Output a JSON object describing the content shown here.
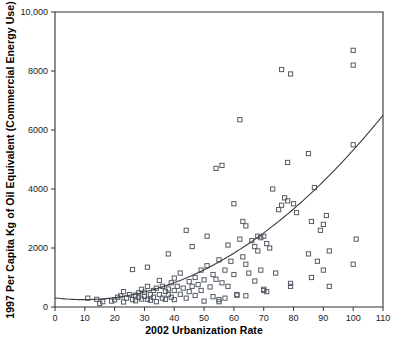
{
  "chart_data": {
    "type": "scatter",
    "title": "",
    "xlabel": "2002 Urbanization Rate",
    "ylabel": "1997 Per Capita Kg of Oil Equivalent (Commercial Energy Use)",
    "xlim": [
      0,
      110
    ],
    "ylim": [
      0,
      10000
    ],
    "xticks": [
      0,
      10,
      20,
      30,
      40,
      50,
      60,
      70,
      80,
      90,
      100,
      110
    ],
    "xtick_labels": [
      "0",
      "10",
      "20",
      "30",
      "40",
      "50",
      "60",
      "70",
      "80",
      "90",
      "100",
      "110"
    ],
    "yticks": [
      0,
      2000,
      4000,
      6000,
      8000,
      10000
    ],
    "ytick_labels": [
      "0",
      "2000",
      "4000",
      "6000",
      "8000",
      "10,000"
    ],
    "grid": false,
    "legend": null,
    "marker": "open-square",
    "marker_color": "#555b66",
    "curve_color": "#3d3d3d",
    "points": [
      [
        11,
        300
      ],
      [
        14,
        260
      ],
      [
        15,
        120
      ],
      [
        16,
        180
      ],
      [
        19,
        200
      ],
      [
        20,
        240
      ],
      [
        21,
        330
      ],
      [
        22,
        380
      ],
      [
        23,
        170
      ],
      [
        23,
        520
      ],
      [
        24,
        300
      ],
      [
        25,
        420
      ],
      [
        26,
        250
      ],
      [
        26,
        1270
      ],
      [
        27,
        400
      ],
      [
        27,
        210
      ],
      [
        28,
        480
      ],
      [
        28,
        330
      ],
      [
        29,
        600
      ],
      [
        29,
        270
      ],
      [
        30,
        500
      ],
      [
        30,
        360
      ],
      [
        31,
        700
      ],
      [
        31,
        260
      ],
      [
        31,
        1350
      ],
      [
        32,
        420
      ],
      [
        32,
        230
      ],
      [
        33,
        560
      ],
      [
        33,
        330
      ],
      [
        34,
        640
      ],
      [
        34,
        180
      ],
      [
        35,
        420
      ],
      [
        35,
        900
      ],
      [
        36,
        300
      ],
      [
        36,
        700
      ],
      [
        37,
        530
      ],
      [
        37,
        260
      ],
      [
        38,
        1800
      ],
      [
        38,
        610
      ],
      [
        38,
        420
      ],
      [
        39,
        820
      ],
      [
        39,
        330
      ],
      [
        40,
        980
      ],
      [
        40,
        560
      ],
      [
        40,
        250
      ],
      [
        41,
        700
      ],
      [
        42,
        1150
      ],
      [
        42,
        430
      ],
      [
        43,
        640
      ],
      [
        44,
        2600
      ],
      [
        44,
        300
      ],
      [
        45,
        860
      ],
      [
        45,
        520
      ],
      [
        46,
        2050
      ],
      [
        46,
        700
      ],
      [
        47,
        1000
      ],
      [
        47,
        390
      ],
      [
        48,
        760
      ],
      [
        49,
        1250
      ],
      [
        49,
        560
      ],
      [
        50,
        920
      ],
      [
        50,
        200
      ],
      [
        51,
        2400
      ],
      [
        51,
        1400
      ],
      [
        52,
        680
      ],
      [
        53,
        1100
      ],
      [
        53,
        350
      ],
      [
        54,
        4700
      ],
      [
        54,
        940
      ],
      [
        55,
        1600
      ],
      [
        55,
        250
      ],
      [
        55,
        180
      ],
      [
        56,
        4800
      ],
      [
        56,
        820
      ],
      [
        57,
        1250
      ],
      [
        57,
        300
      ],
      [
        58,
        2100
      ],
      [
        58,
        700
      ],
      [
        59,
        1550
      ],
      [
        60,
        3500
      ],
      [
        60,
        1100
      ],
      [
        61,
        420
      ],
      [
        61,
        400
      ],
      [
        62,
        2300
      ],
      [
        62,
        6350
      ],
      [
        63,
        2900
      ],
      [
        63,
        1700
      ],
      [
        64,
        2750
      ],
      [
        64,
        1450
      ],
      [
        64,
        380
      ],
      [
        65,
        1150
      ],
      [
        66,
        2250
      ],
      [
        67,
        2050
      ],
      [
        67,
        880
      ],
      [
        68,
        2400
      ],
      [
        68,
        1900
      ],
      [
        69,
        2350
      ],
      [
        69,
        1250
      ],
      [
        70,
        2400
      ],
      [
        70,
        560
      ],
      [
        70,
        600
      ],
      [
        71,
        2150
      ],
      [
        71,
        520
      ],
      [
        72,
        2000
      ],
      [
        73,
        4000
      ],
      [
        74,
        1150
      ],
      [
        75,
        3300
      ],
      [
        76,
        8050
      ],
      [
        76,
        3450
      ],
      [
        77,
        3700
      ],
      [
        78,
        4900
      ],
      [
        78,
        3600
      ],
      [
        79,
        7900
      ],
      [
        79,
        800
      ],
      [
        79,
        700
      ],
      [
        80,
        3500
      ],
      [
        81,
        3200
      ],
      [
        85,
        5200
      ],
      [
        85,
        1800
      ],
      [
        86,
        2900
      ],
      [
        86,
        1000
      ],
      [
        87,
        4050
      ],
      [
        88,
        1550
      ],
      [
        89,
        2600
      ],
      [
        90,
        2800
      ],
      [
        90,
        1250
      ],
      [
        91,
        3100
      ],
      [
        92,
        1900
      ],
      [
        92,
        700
      ],
      [
        100,
        8700
      ],
      [
        100,
        8200
      ],
      [
        100,
        1450
      ],
      [
        100,
        5500
      ],
      [
        101,
        2300
      ]
    ],
    "trend": {
      "description": "quadratic fit line rising from lower-left to upper-right",
      "coefficients_note": "approx y = 250 + 0.5*(x-10) + 0.62*(x-10)^2",
      "endpoints": [
        [
          0,
          250
        ],
        [
          110,
          6050
        ]
      ]
    }
  }
}
